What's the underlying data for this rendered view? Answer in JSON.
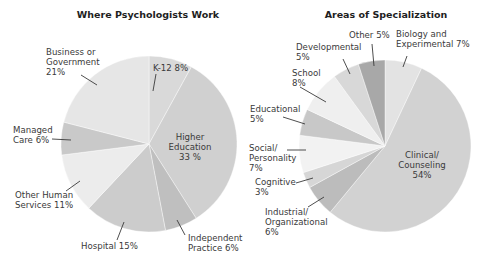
{
  "chart_data": [
    {
      "type": "pie",
      "title": "Where Psychologists Work",
      "center": [
        149,
        144
      ],
      "radius": 88,
      "slices": [
        {
          "label": "K-12",
          "value": 8,
          "color": "#d9d9d9",
          "label_lines": [
            "K-12 8%"
          ],
          "label_pos": [
            153,
            71
          ],
          "anchor": "start",
          "leader": [
            [
              156,
              74
            ],
            [
              153,
              91
            ]
          ]
        },
        {
          "label": "Higher Education",
          "value": 33,
          "color": "#d0d0d0",
          "label_lines": [
            "Higher",
            "Education",
            "33 %"
          ],
          "label_pos": [
            190,
            140
          ],
          "anchor": "middle",
          "leader": null
        },
        {
          "label": "Independent Practice",
          "value": 6,
          "color": "#bfbfbf",
          "label_lines": [
            "Independent",
            "Practice 6%"
          ],
          "label_pos": [
            188,
            241
          ],
          "anchor": "start",
          "leader": [
            [
              185,
              235
            ],
            [
              177,
              220
            ]
          ]
        },
        {
          "label": "Hospital",
          "value": 15,
          "color": "#cccccc",
          "label_lines": [
            "Hospital 15%"
          ],
          "label_pos": [
            81,
            249
          ],
          "anchor": "start",
          "leader": [
            [
              117,
              240
            ],
            [
              124,
              222
            ]
          ]
        },
        {
          "label": "Other Human Services",
          "value": 11,
          "color": "#ececec",
          "label_lines": [
            "Other Human",
            "Services 11%"
          ],
          "label_pos": [
            15,
            198
          ],
          "anchor": "start",
          "leader": [
            [
              66,
              191
            ],
            [
              80,
              181
            ]
          ]
        },
        {
          "label": "Managed Care",
          "value": 6,
          "color": "#c9c9c9",
          "label_lines": [
            "Managed",
            "Care 6%"
          ],
          "label_pos": [
            13,
            133
          ],
          "anchor": "start",
          "leader": [
            [
              52,
              139
            ],
            [
              71,
              140
            ]
          ]
        },
        {
          "label": "Business or Government",
          "value": 21,
          "color": "#e6e6e6",
          "label_lines": [
            "Business or",
            "Government",
            "21%"
          ],
          "label_pos": [
            46,
            55
          ],
          "anchor": "start",
          "leader": [
            [
              81,
              75
            ],
            [
              97,
              85
            ]
          ]
        }
      ]
    },
    {
      "type": "pie",
      "title": "Areas of Specialization",
      "center": [
        385,
        146
      ],
      "radius": 86,
      "slices": [
        {
          "label": "Biology and Experimental",
          "value": 7,
          "color": "#e3e3e3",
          "label_lines": [
            "Biology and",
            "Experimental 7%"
          ],
          "label_pos": [
            396,
            37
          ],
          "anchor": "start",
          "leader": [
            [
              407,
              56
            ],
            [
              403,
              67
            ]
          ]
        },
        {
          "label": "Clinical/Counseling",
          "value": 54,
          "color": "#d2d2d2",
          "label_lines": [
            "Clinical/",
            "Counseling",
            "54%"
          ],
          "label_pos": [
            422,
            158
          ],
          "anchor": "middle",
          "leader": null
        },
        {
          "label": "Industrial/Organizational",
          "value": 6,
          "color": "#bcbcbc",
          "label_lines": [
            "Industrial/",
            "Organizational",
            "6%"
          ],
          "label_pos": [
            265,
            215
          ],
          "anchor": "start",
          "leader": [
            [
              308,
              207
            ],
            [
              324,
              197
            ]
          ]
        },
        {
          "label": "Cognitive",
          "value": 3,
          "color": "#d6d6d6",
          "label_lines": [
            "Cognitive",
            "3%"
          ],
          "label_pos": [
            255,
            185
          ],
          "anchor": "start",
          "leader": [
            [
              296,
              183
            ],
            [
              313,
              178
            ]
          ]
        },
        {
          "label": "Social/Personality",
          "value": 7,
          "color": "#f2f2f2",
          "label_lines": [
            "Social/",
            "Personality",
            "7%"
          ],
          "label_pos": [
            249,
            151
          ],
          "anchor": "start",
          "leader": [
            [
              287,
              150
            ],
            [
              306,
              150
            ]
          ]
        },
        {
          "label": "Educational",
          "value": 5,
          "color": "#c8c8c8",
          "label_lines": [
            "Educational",
            "5%"
          ],
          "label_pos": [
            250,
            112
          ],
          "anchor": "start",
          "leader": [
            [
              283,
              117
            ],
            [
              305,
              124
            ]
          ]
        },
        {
          "label": "School",
          "value": 8,
          "color": "#efefef",
          "label_lines": [
            "School",
            "8%"
          ],
          "label_pos": [
            292,
            76
          ],
          "anchor": "start",
          "leader": [
            [
              300,
              87
            ],
            [
              326,
              102
            ]
          ]
        },
        {
          "label": "Developmental",
          "value": 5,
          "color": "#d8d8d8",
          "label_lines": [
            "Developmental",
            "5%"
          ],
          "label_pos": [
            296,
            50
          ],
          "anchor": "start",
          "leader": [
            [
              343,
              59
            ],
            [
              350,
              74
            ]
          ]
        },
        {
          "label": "Other",
          "value": 5,
          "color": "#a8a8a8",
          "label_lines": [
            "Other 5%"
          ],
          "label_pos": [
            349,
            38
          ],
          "anchor": "start",
          "leader": [
            [
              372,
              44
            ],
            [
              374,
              66
            ]
          ]
        }
      ]
    }
  ],
  "titles": {
    "left": "Where Psychologists Work",
    "right": "Areas of Specialization"
  }
}
